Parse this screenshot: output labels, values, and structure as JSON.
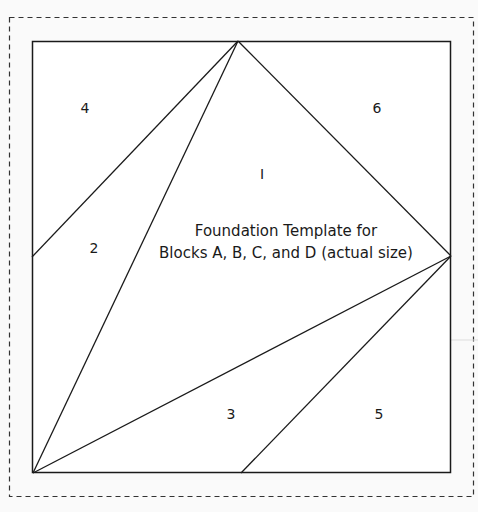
{
  "diagram": {
    "title_lines": [
      "Foundation Template for",
      "Blocks A, B, C, and D (actual size)"
    ],
    "pieces": [
      {
        "id": "1",
        "label": "I",
        "x": 262,
        "y": 179
      },
      {
        "id": "2",
        "label": "2",
        "x": 94,
        "y": 253
      },
      {
        "id": "3",
        "label": "3",
        "x": 231,
        "y": 419
      },
      {
        "id": "4",
        "label": "4",
        "x": 85,
        "y": 113
      },
      {
        "id": "5",
        "label": "5",
        "x": 379,
        "y": 419
      },
      {
        "id": "6",
        "label": "6",
        "x": 377,
        "y": 113
      }
    ],
    "colors": {
      "background": "#fafafa",
      "block_fill": "#ffffff",
      "line": "#1a1a1a",
      "dash": "#333333"
    }
  }
}
